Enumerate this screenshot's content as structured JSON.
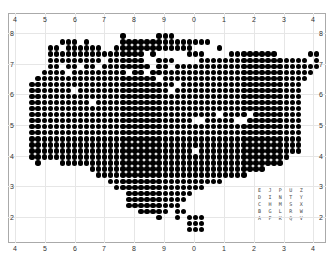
{
  "grid": {
    "x_ticks_top": [
      "4",
      "5",
      "6",
      "7",
      "8",
      "9",
      "0",
      "1",
      "2",
      "3",
      "4"
    ],
    "x_ticks_bottom": [
      "4",
      "5",
      "6",
      "7",
      "8",
      "9",
      "0",
      "1",
      "2",
      "3",
      "4"
    ],
    "x_tick_positions": [
      15,
      45,
      75,
      104,
      134,
      164,
      194,
      224,
      254,
      284,
      313
    ],
    "y_ticks_left": [
      "8",
      "7",
      "6",
      "5",
      "4",
      "3",
      "2"
    ],
    "y_ticks_right": [
      "8",
      "7",
      "6",
      "5",
      "4",
      "3",
      "2"
    ],
    "y_tick_positions": [
      33,
      64,
      94,
      125,
      156,
      186,
      217
    ]
  },
  "dots": {
    "origin_x": 20,
    "origin_y": 36,
    "pitch": 6.05,
    "rows": [
      [
        [
          17,
          17
        ],
        [
          23,
          25
        ]
      ],
      [
        [
          7,
          9
        ],
        [
          11,
          11
        ],
        [
          17,
          31
        ]
      ],
      [
        [
          5,
          6
        ],
        [
          8,
          13
        ],
        [
          16,
          28
        ],
        [
          33,
          33
        ]
      ],
      [
        [
          5,
          14
        ],
        [
          15,
          20
        ],
        [
          22,
          22
        ],
        [
          28,
          30
        ],
        [
          35,
          42
        ],
        [
          48,
          49
        ]
      ],
      [
        [
          5,
          11
        ],
        [
          12,
          13
        ],
        [
          15,
          20
        ],
        [
          23,
          25
        ],
        [
          30,
          47
        ],
        [
          49,
          49
        ]
      ],
      [
        [
          5,
          6
        ],
        [
          8,
          9
        ],
        [
          11,
          12
        ],
        [
          14,
          21
        ],
        [
          23,
          24
        ],
        [
          26,
          49
        ]
      ],
      [
        [
          4,
          7
        ],
        [
          9,
          12
        ],
        [
          13,
          17
        ],
        [
          19,
          20
        ],
        [
          22,
          48
        ]
      ],
      [
        [
          3,
          22
        ],
        [
          24,
          47
        ]
      ],
      [
        [
          2,
          25
        ],
        [
          27,
          46
        ]
      ],
      [
        [
          2,
          8
        ],
        [
          10,
          24
        ],
        [
          26,
          46
        ]
      ],
      [
        [
          2,
          46
        ]
      ],
      [
        [
          2,
          11
        ],
        [
          13,
          46
        ]
      ],
      [
        [
          2,
          46
        ]
      ],
      [
        [
          2,
          32
        ],
        [
          34,
          37
        ],
        [
          39,
          46
        ]
      ],
      [
        [
          2,
          28
        ],
        [
          31,
          35
        ],
        [
          38,
          46
        ]
      ],
      [
        [
          2,
          46
        ]
      ],
      [
        [
          2,
          46
        ]
      ],
      [
        [
          2,
          46
        ]
      ],
      [
        [
          2,
          46
        ]
      ],
      [
        [
          2,
          28
        ],
        [
          30,
          46
        ]
      ],
      [
        [
          2,
          44
        ]
      ],
      [
        [
          3,
          3
        ],
        [
          7,
          43
        ]
      ],
      [
        [
          12,
          40
        ]
      ],
      [
        [
          13,
          37
        ]
      ],
      [
        [
          15,
          33
        ]
      ],
      [
        [
          16,
          30
        ]
      ],
      [
        [
          18,
          28
        ]
      ],
      [
        [
          18,
          27
        ]
      ],
      [
        [
          18,
          26
        ]
      ],
      [
        [
          20,
          24
        ],
        [
          26,
          27
        ]
      ],
      [
        [
          23,
          23
        ],
        [
          26,
          26
        ],
        [
          28,
          30
        ]
      ],
      [
        [
          28,
          30
        ]
      ],
      [
        [
          28,
          30
        ]
      ]
    ]
  },
  "legend": {
    "rows": [
      "EJPUZ",
      "DINTY",
      "CHMSX",
      "BGLRW",
      "AFKQV"
    ]
  },
  "colors": {
    "dot": "#000000",
    "grid": "#e6e6e6",
    "frame": "#aaaaaa"
  }
}
